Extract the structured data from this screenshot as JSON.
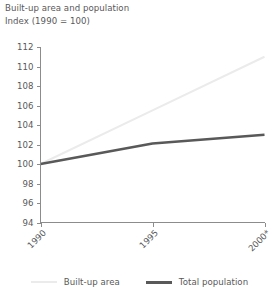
{
  "chart_data": {
    "type": "line",
    "title": "Built-up area and population",
    "subtitle": "Index (1990 = 100)",
    "xlabel": "",
    "ylabel": "",
    "x": [
      1990,
      1995,
      2000
    ],
    "xtick_labels": [
      "1990",
      "1995",
      "2000*"
    ],
    "ytick_labels": [
      "94",
      "96",
      "98",
      "100",
      "102",
      "104",
      "106",
      "108",
      "110",
      "112"
    ],
    "yticks": [
      94,
      96,
      98,
      100,
      102,
      104,
      106,
      108,
      110,
      112
    ],
    "ylim": [
      94,
      112
    ],
    "xlim": [
      1990,
      2000
    ],
    "grid": false,
    "legend_position": "bottom",
    "series": [
      {
        "name": "Built-up area",
        "values": [
          100,
          105.5,
          111.0
        ],
        "color": "#ebebeb",
        "width": 2
      },
      {
        "name": "Total population",
        "values": [
          100,
          102.1,
          103.0
        ],
        "color": "#595959",
        "width": 2.6
      }
    ],
    "footnote_marker": "*"
  },
  "legend": {
    "items": [
      {
        "label": "Built-up area",
        "color": "#ebebeb"
      },
      {
        "label": "Total population",
        "color": "#595959"
      }
    ]
  }
}
